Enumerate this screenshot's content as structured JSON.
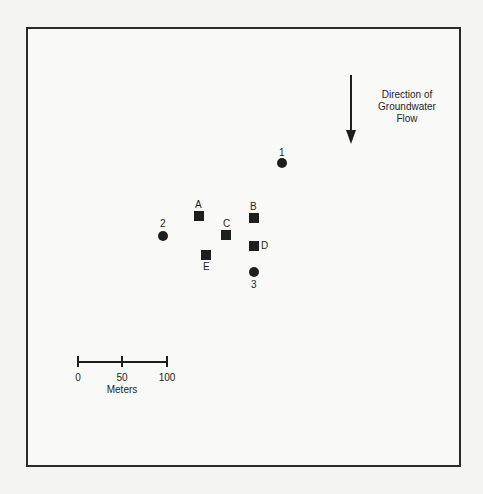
{
  "diagram": {
    "type": "site-map",
    "flow": {
      "label_lines": [
        "Direction of",
        "Groundwater",
        "Flow"
      ],
      "direction": "down",
      "icon": "arrow-down-icon"
    },
    "wells": [
      {
        "id": "1",
        "shape": "circle",
        "x": 282,
        "y": 163,
        "label_pos": "above"
      },
      {
        "id": "2",
        "shape": "circle",
        "x": 163,
        "y": 236,
        "label_pos": "above"
      },
      {
        "id": "3",
        "shape": "circle",
        "x": 254,
        "y": 272,
        "label_pos": "below"
      }
    ],
    "samples": [
      {
        "id": "A",
        "shape": "square",
        "x": 199,
        "y": 216,
        "label_pos": "above"
      },
      {
        "id": "B",
        "shape": "square",
        "x": 254,
        "y": 218,
        "label_pos": "above"
      },
      {
        "id": "C",
        "shape": "square",
        "x": 226,
        "y": 235,
        "label_pos": "above"
      },
      {
        "id": "D",
        "shape": "square",
        "x": 254,
        "y": 246,
        "label_pos": "right"
      },
      {
        "id": "E",
        "shape": "square",
        "x": 206,
        "y": 255,
        "label_pos": "below"
      }
    ],
    "scale_bar": {
      "ticks": [
        "0",
        "50",
        "100"
      ],
      "unit": "Meters"
    },
    "colors": {
      "ink": "#1e1e1e",
      "background": "#f9f9f7",
      "frame": "#2a2a2a"
    }
  }
}
